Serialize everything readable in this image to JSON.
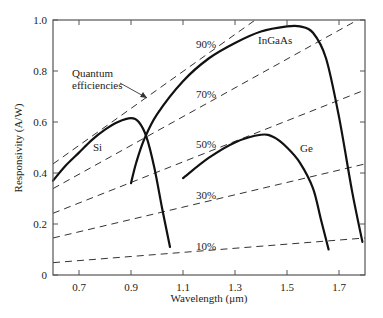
{
  "chart_data": {
    "type": "line",
    "title": "",
    "xlabel": "Wavelength (μm)",
    "ylabel": "Responsivity (A/W)",
    "xlim": [
      0.6,
      1.8
    ],
    "ylim": [
      0,
      1.0
    ],
    "xticks": [
      "0.7",
      "0.9",
      "1.1",
      "1.3",
      "1.5",
      "1.7"
    ],
    "yticks": [
      "0",
      "0.2",
      "0.4",
      "0.6",
      "0.8",
      "1.0"
    ],
    "grid": false,
    "legend": "none (inline curve labels)",
    "series": [
      {
        "name": "Si",
        "style": "solid",
        "x": [
          0.6,
          0.65,
          0.7,
          0.75,
          0.8,
          0.85,
          0.9,
          0.93,
          0.96,
          0.99,
          1.02,
          1.05
        ],
        "y": [
          0.37,
          0.43,
          0.48,
          0.53,
          0.57,
          0.6,
          0.615,
          0.6,
          0.54,
          0.42,
          0.26,
          0.11
        ]
      },
      {
        "name": "InGaAs",
        "style": "solid",
        "x": [
          0.9,
          0.92,
          0.95,
          1.0,
          1.1,
          1.2,
          1.3,
          1.4,
          1.5,
          1.55,
          1.6,
          1.65,
          1.7,
          1.75,
          1.79
        ],
        "y": [
          0.36,
          0.44,
          0.53,
          0.63,
          0.76,
          0.85,
          0.91,
          0.955,
          0.975,
          0.975,
          0.95,
          0.85,
          0.62,
          0.33,
          0.13
        ]
      },
      {
        "name": "Ge",
        "style": "solid",
        "x": [
          1.1,
          1.2,
          1.3,
          1.4,
          1.45,
          1.5,
          1.55,
          1.6,
          1.63,
          1.66
        ],
        "y": [
          0.38,
          0.46,
          0.52,
          0.55,
          0.54,
          0.5,
          0.44,
          0.34,
          0.22,
          0.1
        ]
      }
    ],
    "reference_lines": [
      {
        "name": "90%",
        "style": "dashed",
        "quantum_efficiency": 0.9,
        "formula": "R = 0.9 * λ / 1.24"
      },
      {
        "name": "70%",
        "style": "dashed",
        "quantum_efficiency": 0.7,
        "formula": "R = 0.7 * λ / 1.24"
      },
      {
        "name": "50%",
        "style": "dashed",
        "quantum_efficiency": 0.5,
        "formula": "R = 0.5 * λ / 1.24"
      },
      {
        "name": "30%",
        "style": "dashed",
        "quantum_efficiency": 0.3,
        "formula": "R = 0.3 * λ / 1.24"
      },
      {
        "name": "10%",
        "style": "dashed",
        "quantum_efficiency": 0.1,
        "formula": "R = 0.1 * λ / 1.24"
      }
    ],
    "annotations": [
      {
        "text": "Quantum efficiencies",
        "points_to": "90% dashed line"
      },
      {
        "text": "Si"
      },
      {
        "text": "InGaAs"
      },
      {
        "text": "Ge"
      },
      {
        "text": "90%"
      },
      {
        "text": "70%"
      },
      {
        "text": "50%"
      },
      {
        "text": "30%"
      },
      {
        "text": "10%"
      }
    ]
  },
  "labels": {
    "xlabel": "Wavelength (μm)",
    "ylabel": "Responsivity (A/W)",
    "annot_qe_line1": "Quantum",
    "annot_qe_line2": "efficiencies",
    "si": "Si",
    "ingaas": "InGaAs",
    "ge": "Ge",
    "qe90": "90%",
    "qe70": "70%",
    "qe50": "50%",
    "qe30": "30%",
    "qe10": "10%"
  }
}
